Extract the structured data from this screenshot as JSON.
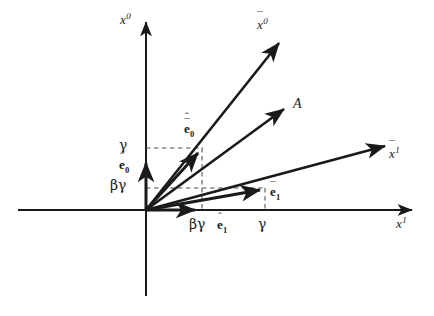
{
  "figure": {
    "width": 434,
    "height": 316,
    "background_color": "#ffffff",
    "line_color": "#1a1a1a",
    "dash_color": "#4d4d4d"
  },
  "axes": {
    "vertical": {
      "name": "x0-axis",
      "label_base": "x",
      "label_sup": "0",
      "origin": [
        146,
        210
      ],
      "tip": [
        146,
        18
      ]
    },
    "horizontal": {
      "name": "x1-axis",
      "label_base": "x",
      "label_sup": "1",
      "origin": [
        146,
        210
      ],
      "tip": [
        415,
        210
      ]
    }
  },
  "vectors": [
    {
      "id": "x0-bar-axis",
      "label_base": "x",
      "label_sup": "0",
      "accent": "bar",
      "from": [
        146,
        210
      ],
      "to": [
        283,
        38
      ],
      "weight": "heavy"
    },
    {
      "id": "vector-A",
      "label_base": "A",
      "accent": "none",
      "from": [
        146,
        210
      ],
      "to": [
        288,
        105
      ],
      "weight": "heavy"
    },
    {
      "id": "x1-bar-axis",
      "label_base": "x",
      "label_sup": "1",
      "accent": "bar",
      "from": [
        146,
        210
      ],
      "to": [
        390,
        142
      ],
      "weight": "heavy"
    },
    {
      "id": "e0-hat",
      "label_base": "e",
      "label_sub": "0",
      "accent": "hat",
      "from": [
        146,
        210
      ],
      "to": [
        146,
        158
      ],
      "weight": "heavy"
    },
    {
      "id": "e1-hat",
      "label_base": "e",
      "label_sub": "1",
      "accent": "hat",
      "from": [
        146,
        210
      ],
      "to": [
        200,
        210
      ],
      "weight": "heavy"
    },
    {
      "id": "e0-bar-hat",
      "label_base": "e",
      "label_sub": "0",
      "accent": "hat-bar",
      "from": [
        146,
        210
      ],
      "to": [
        202,
        148
      ],
      "weight": "heavy"
    },
    {
      "id": "e1-bar-hat",
      "label_base": "e",
      "label_sub": "1",
      "accent": "hat-bar",
      "from": [
        146,
        210
      ],
      "to": [
        265,
        188
      ],
      "weight": "heavy"
    }
  ],
  "labels": {
    "x0_axis": {
      "text": "x",
      "sup": "0"
    },
    "x1_axis": {
      "text": "x",
      "sup": "1"
    },
    "x0_bar": {
      "text": "x",
      "sup": "0"
    },
    "x1_bar": {
      "text": "x",
      "sup": "1"
    },
    "vector_A": {
      "text": "A"
    },
    "e0_hat": {
      "text": "e",
      "sub": "0"
    },
    "e1_hat": {
      "text": "e",
      "sub": "1"
    },
    "e0_bar_hat": {
      "text": "e",
      "sub": "0"
    },
    "e1_bar_hat": {
      "text": "e",
      "sub": "1"
    },
    "hat_glyph": "ˆ",
    "bar_glyph": "¯"
  },
  "tick_labels": {
    "vertical": [
      {
        "id": "gamma-y",
        "text": "γ",
        "value_at": 148
      },
      {
        "id": "beta-gamma-y",
        "text": "βγ",
        "value_at": 188
      }
    ],
    "horizontal": [
      {
        "id": "beta-gamma-x",
        "text": "βγ",
        "value_at": 202
      },
      {
        "id": "gamma-x",
        "text": "γ",
        "value_at": 265
      }
    ]
  },
  "projection_lines": [
    {
      "id": "gamma-horizontal-dashed",
      "from": [
        146,
        148
      ],
      "to": [
        202,
        148
      ]
    },
    {
      "id": "beta-gamma-horizontal-dashed",
      "from": [
        146,
        188
      ],
      "to": [
        265,
        188
      ]
    },
    {
      "id": "beta-gamma-vertical-dashed",
      "from": [
        202,
        148
      ],
      "to": [
        202,
        210
      ]
    },
    {
      "id": "gamma-vertical-dashed",
      "from": [
        265,
        188
      ],
      "to": [
        265,
        210
      ]
    }
  ]
}
